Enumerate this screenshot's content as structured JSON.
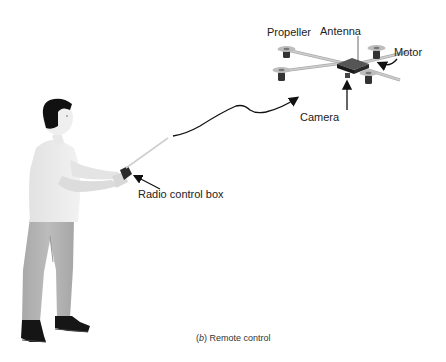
{
  "figure": {
    "caption_letter": "b",
    "caption_text": "Remote control",
    "caption_open": "(",
    "caption_close": ")"
  },
  "labels": {
    "propeller": "Propeller",
    "antenna": "Antenna",
    "motor": "Motor",
    "camera": "Camera",
    "radio_control_box": "Radio control box"
  },
  "colors": {
    "background": "#ffffff",
    "text": "#222222",
    "shirt": "#ebebeb",
    "pants": "#b4b4b4",
    "hair": "#111111",
    "shoes": "#151515",
    "drone_body": "#333333",
    "arrow": "#111111"
  }
}
